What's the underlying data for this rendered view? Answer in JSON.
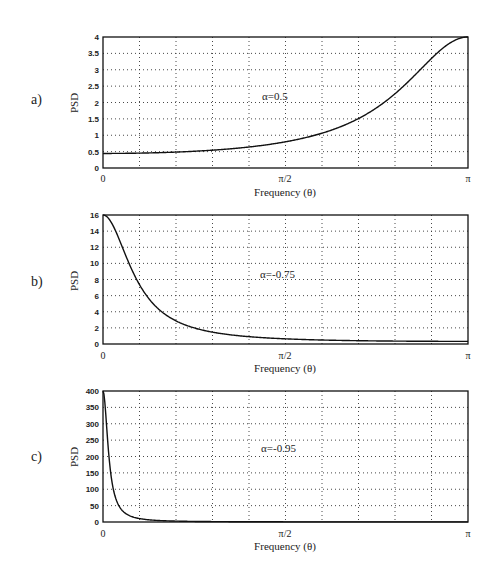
{
  "chart_data": [
    {
      "type": "line",
      "panel_label": "a)",
      "annotation": "α=0.5",
      "alpha": 0.5,
      "xlabel": "Frequency (θ)",
      "ylabel": "PSD",
      "x_ticks": [
        "0",
        "π/2",
        "π"
      ],
      "xlim": [
        0,
        3.14159
      ],
      "ylim": [
        0,
        4
      ],
      "y_ticks": [
        "0",
        "0.5",
        "1",
        "1.5",
        "2",
        "2.5",
        "3",
        "3.5",
        "4"
      ],
      "grid": true,
      "x_grid_divisions": 10,
      "formula": "PSD(θ) = 1 / (1 + 2α·cos θ + α²)",
      "x": [
        0,
        0.3142,
        0.6283,
        0.9425,
        1.2566,
        1.5708,
        1.885,
        2.1991,
        2.5133,
        2.8274,
        3.1416
      ],
      "values": [
        0.444,
        0.456,
        0.495,
        0.57,
        0.697,
        0.8,
        1.068,
        1.457,
        2.065,
        2.965,
        4.0
      ]
    },
    {
      "type": "line",
      "panel_label": "b)",
      "annotation": "α=-0.75",
      "alpha": -0.75,
      "xlabel": "Frequency (θ)",
      "ylabel": "PSD",
      "x_ticks": [
        "0",
        "π/2",
        "π"
      ],
      "xlim": [
        0,
        3.14159
      ],
      "ylim": [
        0,
        16
      ],
      "y_ticks": [
        "0",
        "2",
        "4",
        "6",
        "8",
        "10",
        "12",
        "14",
        "16"
      ],
      "grid": true,
      "x_grid_divisions": 10,
      "formula": "PSD(θ) = 1 / (1 + 2α·cos θ + α²)",
      "x": [
        0,
        0.3142,
        0.6283,
        0.9425,
        1.2566,
        1.5708,
        1.885,
        2.1991,
        2.5133,
        2.8274,
        3.1416
      ],
      "values": [
        16.0,
        6.91,
        2.62,
        1.37,
        0.89,
        0.64,
        0.5,
        0.42,
        0.37,
        0.34,
        0.33
      ]
    },
    {
      "type": "line",
      "panel_label": "c)",
      "annotation": "α=-0.95",
      "alpha": -0.95,
      "xlabel": "Frequency (θ)",
      "ylabel": "PSD",
      "x_ticks": [
        "0",
        "π/2",
        "π"
      ],
      "xlim": [
        0,
        3.14159
      ],
      "ylim": [
        0,
        400
      ],
      "y_ticks": [
        "0",
        "50",
        "100",
        "150",
        "200",
        "250",
        "300",
        "350",
        "400"
      ],
      "grid": true,
      "x_grid_divisions": 10,
      "formula": "PSD(θ) = 1 / (1 + 2α·cos θ + α²)",
      "x": [
        0,
        0.3142,
        0.6283,
        0.9425,
        1.2566,
        1.5708,
        1.885,
        2.1991,
        2.5133,
        2.8274,
        3.1416
      ],
      "values": [
        400.0,
        10.3,
        2.73,
        1.33,
        0.83,
        0.53,
        0.4,
        0.32,
        0.28,
        0.26,
        0.26
      ]
    }
  ]
}
